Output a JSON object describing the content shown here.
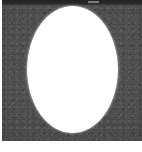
{
  "figure": {
    "kind": "grayscale-micrograph-thumbnail",
    "image": {
      "alt_label": "white ellipse on dark grainy field",
      "background_color": "#4d4d4d",
      "shape_color": "#ffffff",
      "top_band_color": "#262626",
      "top_band_mark_label": ""
    },
    "caption": {
      "text": "",
      "color": "#b9b9b9"
    }
  }
}
